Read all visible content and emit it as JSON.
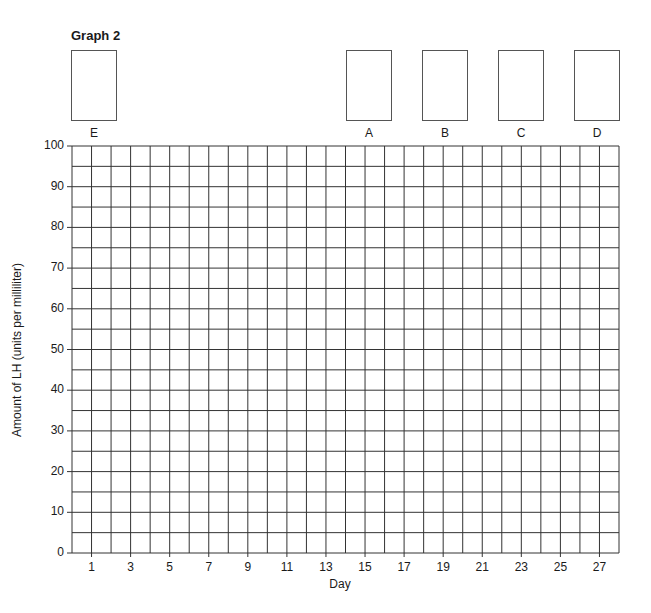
{
  "chart_data": {
    "type": "line",
    "title": "Graph 2",
    "xlabel": "Day",
    "ylabel": "Amount of LH (units per milliliter)",
    "x_tick_labels": [
      "1",
      "3",
      "5",
      "7",
      "9",
      "11",
      "13",
      "15",
      "17",
      "19",
      "21",
      "23",
      "25",
      "27"
    ],
    "y_tick_labels": [
      "0",
      "10",
      "20",
      "30",
      "40",
      "50",
      "60",
      "70",
      "80",
      "90",
      "100"
    ],
    "xlim": [
      1,
      28
    ],
    "ylim": [
      0,
      100
    ],
    "grid": true,
    "grid_minor_y_step": 5,
    "grid_x_step": 1,
    "series": [],
    "answer_boxes": [
      {
        "label": "E",
        "value": ""
      },
      {
        "label": "A",
        "value": ""
      },
      {
        "label": "B",
        "value": ""
      },
      {
        "label": "C",
        "value": ""
      },
      {
        "label": "D",
        "value": ""
      }
    ]
  },
  "colors": {
    "grid": "#333333",
    "text": "#1a1a1a"
  }
}
